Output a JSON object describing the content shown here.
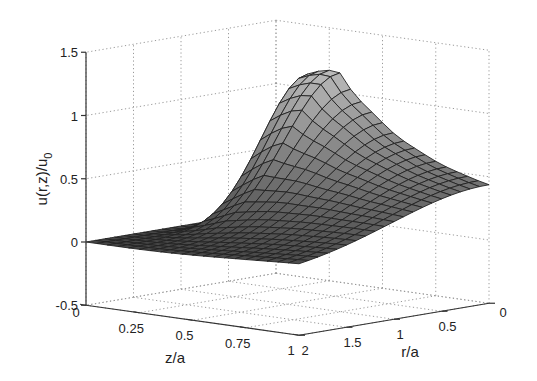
{
  "chart_data": {
    "type": "surface3d",
    "title": "",
    "xlabel": "z/a",
    "ylabel": "r/a",
    "zlabel": "u(r,z)/u0",
    "zlabel_parts": {
      "main": "u(r,z)/u",
      "subscript": "0"
    },
    "x_ticks": [
      "0",
      "0.25",
      "0.5",
      "0.75",
      "1"
    ],
    "x_tick_values": [
      0,
      0.25,
      0.5,
      0.75,
      1
    ],
    "y_ticks": [
      "0",
      "0.5",
      "1",
      "1.5",
      "2"
    ],
    "y_tick_values": [
      0,
      0.5,
      1,
      1.5,
      2
    ],
    "z_ticks": [
      "-0.5",
      "0",
      "0.5",
      "1",
      "1.5"
    ],
    "z_tick_values": [
      -0.5,
      0,
      0.5,
      1,
      1.5
    ],
    "xlim": [
      0,
      1
    ],
    "ylim": [
      0,
      2
    ],
    "zlim": [
      -0.5,
      1.5
    ],
    "grid": true,
    "colormap": "gray",
    "x": [
      0,
      0.05,
      0.1,
      0.15,
      0.2,
      0.25,
      0.3,
      0.35,
      0.4,
      0.45,
      0.5,
      0.55,
      0.6,
      0.65,
      0.7,
      0.75,
      0.8,
      0.85,
      0.9,
      0.95,
      1.0
    ],
    "y": [
      0,
      0.1,
      0.2,
      0.3,
      0.4,
      0.5,
      0.6,
      0.7,
      0.8,
      0.9,
      1.0,
      1.1,
      1.2,
      1.3,
      1.4,
      1.5,
      1.6,
      1.7,
      1.8,
      1.9,
      2.0
    ],
    "peak_value": 1.15,
    "value_at_z1_r0": 0.3
  }
}
